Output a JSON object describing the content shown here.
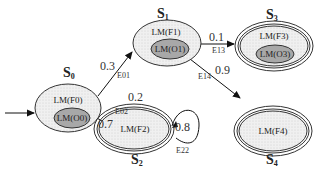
{
  "diagram": {
    "type": "state-transition-diagram",
    "colors": {
      "outer_fill": "#eeeeee",
      "inner_fill": "#aaaaaa",
      "stroke": "#333333",
      "background": "#ffffff"
    },
    "states": [
      {
        "id": "S0",
        "name": "S",
        "sub": "0",
        "outer_label": "LM(F0)",
        "inner_label": "LM(O0)",
        "accepting": false,
        "initial": true
      },
      {
        "id": "S1",
        "name": "S",
        "sub": "1",
        "outer_label": "LM(F1)",
        "inner_label": "LM(O1)",
        "accepting": false,
        "initial": false
      },
      {
        "id": "S2",
        "name": "S",
        "sub": "2",
        "outer_label": "LM(F2)",
        "inner_label": null,
        "accepting": true,
        "initial": false
      },
      {
        "id": "S3",
        "name": "S",
        "sub": "3",
        "outer_label": "LM(F3)",
        "inner_label": "LM(O3)",
        "accepting": true,
        "initial": false
      },
      {
        "id": "S4",
        "name": "S",
        "sub": "4",
        "outer_label": "LM(F4)",
        "inner_label": null,
        "accepting": true,
        "initial": false
      }
    ],
    "edges": [
      {
        "from": "S0",
        "to": "S1",
        "prob": "0.3",
        "label": "E01"
      },
      {
        "from": "S0",
        "to": "S2",
        "prob": "0.7",
        "label": "E02"
      },
      {
        "from": "S1",
        "to": "S3",
        "prob": "0.1",
        "label": "E13"
      },
      {
        "from": "S1",
        "to": "S4",
        "prob": "0.9",
        "label": "E14"
      },
      {
        "from": "S2",
        "to": "S2",
        "prob": "0.8",
        "label": "E22"
      }
    ],
    "extra_labels": [
      {
        "text": "0.2",
        "near": "S2"
      }
    ]
  }
}
